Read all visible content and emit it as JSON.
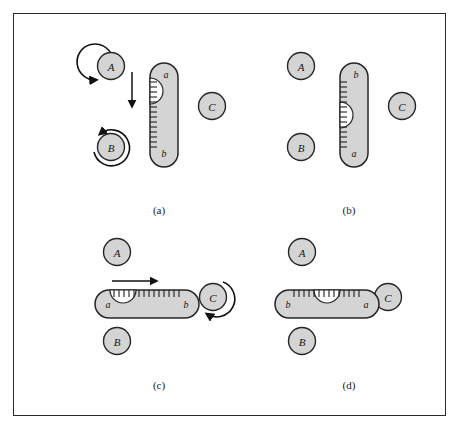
{
  "figure": {
    "background_color": "#ffffff",
    "frame_color": "#2b2b2b",
    "body_fill": "#d4d4d4",
    "body_stroke": "#262626",
    "notch_fill": "#ffffff",
    "tick_color": "#1f1f1f",
    "arrow_color": "#111111"
  },
  "panels": [
    {
      "id": "a",
      "caption": "(a)",
      "body_orientation": "vertical",
      "end_labels": {
        "top": "a",
        "bottom": "b"
      },
      "notch_side": "left",
      "notch_position": "upper",
      "tick_side": "left",
      "circles": [
        {
          "label": "A",
          "rotation": "counterclockwise",
          "arrow": true
        },
        {
          "label": "B",
          "rotation": "counterclockwise",
          "arrow": true
        },
        {
          "label": "C",
          "rotation": "none",
          "arrow": false
        }
      ],
      "translation_arrow": {
        "present": true,
        "direction": "down"
      }
    },
    {
      "id": "b",
      "caption": "(b)",
      "body_orientation": "vertical",
      "end_labels": {
        "top": "b",
        "bottom": "a"
      },
      "notch_side": "left",
      "notch_position": "middle",
      "tick_side": "left",
      "circles": [
        {
          "label": "A",
          "rotation": "none",
          "arrow": false
        },
        {
          "label": "B",
          "rotation": "none",
          "arrow": false
        },
        {
          "label": "C",
          "rotation": "none",
          "arrow": false
        }
      ],
      "translation_arrow": {
        "present": false,
        "direction": ""
      }
    },
    {
      "id": "c",
      "caption": "(c)",
      "body_orientation": "horizontal",
      "end_labels": {
        "left": "a",
        "right": "b"
      },
      "notch_side": "top",
      "notch_position": "left",
      "tick_side": "top",
      "circles": [
        {
          "label": "A",
          "rotation": "none",
          "arrow": false
        },
        {
          "label": "B",
          "rotation": "none",
          "arrow": false
        },
        {
          "label": "C",
          "rotation": "clockwise",
          "arrow": true
        }
      ],
      "translation_arrow": {
        "present": true,
        "direction": "right"
      }
    },
    {
      "id": "d",
      "caption": "(d)",
      "body_orientation": "horizontal",
      "end_labels": {
        "left": "b",
        "right": "a"
      },
      "notch_side": "top",
      "notch_position": "middle",
      "tick_side": "top",
      "circles": [
        {
          "label": "A",
          "rotation": "none",
          "arrow": false
        },
        {
          "label": "B",
          "rotation": "none",
          "arrow": false
        },
        {
          "label": "C",
          "rotation": "none",
          "arrow": false
        }
      ],
      "translation_arrow": {
        "present": false,
        "direction": ""
      }
    }
  ]
}
